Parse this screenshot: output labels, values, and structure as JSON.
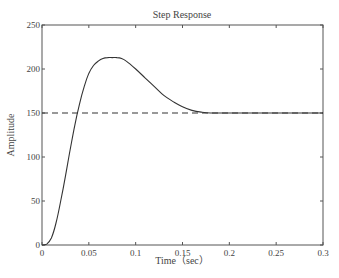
{
  "chart_data": {
    "type": "line",
    "title": "Step Response",
    "xlabel": "Time（sec）",
    "ylabel": "Amplitude",
    "xlim": [
      0,
      0.3
    ],
    "ylim": [
      0,
      250
    ],
    "x_ticks": [
      "0",
      "0.05",
      "0.1",
      "0.15",
      "0.2",
      "0.25",
      "0.3"
    ],
    "y_ticks": [
      "0",
      "50",
      "100",
      "150",
      "200",
      "250"
    ],
    "grid": false,
    "legend": null,
    "series": [
      {
        "name": "step response",
        "style": "solid",
        "x": [
          0,
          0.005,
          0.01,
          0.015,
          0.02,
          0.025,
          0.03,
          0.035,
          0.04,
          0.045,
          0.05,
          0.055,
          0.06,
          0.065,
          0.07,
          0.075,
          0.08,
          0.085,
          0.09,
          0.1,
          0.11,
          0.12,
          0.13,
          0.14,
          0.15,
          0.16,
          0.17,
          0.18,
          0.2,
          0.22,
          0.25,
          0.27,
          0.3
        ],
        "values": [
          0,
          1,
          8,
          25,
          50,
          78,
          108,
          136,
          160,
          180,
          195,
          204,
          209,
          212,
          213,
          213,
          213,
          212,
          209,
          200,
          190,
          180,
          170,
          163,
          157,
          153,
          151,
          150,
          150,
          150,
          150,
          150,
          150
        ]
      },
      {
        "name": "steady-state reference",
        "style": "dashed",
        "x": [
          0,
          0.3
        ],
        "values": [
          150,
          150
        ]
      }
    ]
  }
}
